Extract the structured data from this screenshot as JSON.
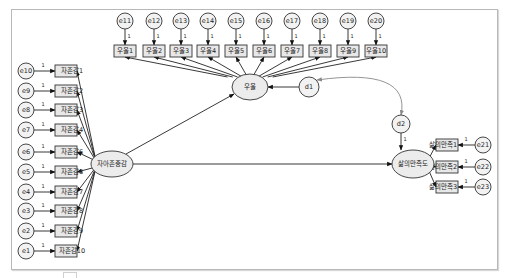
{
  "diagram": {
    "type": "structural-equation-model",
    "latent": [
      {
        "id": "self_esteem",
        "label": "자아존중감",
        "cx": 112,
        "cy": 164,
        "rx": 21,
        "ry": 13
      },
      {
        "id": "depression",
        "label": "우울",
        "cx": 250,
        "cy": 87,
        "rx": 18,
        "ry": 13
      },
      {
        "id": "life_satisfaction",
        "label": "삶의만족도",
        "cx": 413,
        "cy": 164,
        "rx": 21,
        "ry": 14
      }
    ],
    "disturbances": [
      {
        "id": "d1",
        "label": "d1",
        "cx": 309,
        "cy": 87,
        "r": 10,
        "target": "depression"
      },
      {
        "id": "d2",
        "label": "d2",
        "cx": 401,
        "cy": 124,
        "r": 9,
        "target": "life_satisfaction",
        "path_label": "1"
      }
    ],
    "self_esteem_items": [
      {
        "label": "자존감1",
        "error": "e10",
        "y": 71
      },
      {
        "label": "자존감2",
        "error": "e9",
        "y": 91
      },
      {
        "label": "자존감3",
        "error": "e8",
        "y": 110
      },
      {
        "label": "자존감4",
        "error": "e7",
        "y": 130
      },
      {
        "label": "자존감6",
        "error": "e6",
        "y": 152
      },
      {
        "label": "자존감6",
        "error": "e5",
        "y": 172
      },
      {
        "label": "자존감7",
        "error": "e4",
        "y": 192
      },
      {
        "label": "자존감8",
        "error": "e3",
        "y": 211
      },
      {
        "label": "자존감9",
        "error": "e2",
        "y": 231
      },
      {
        "label": "자존감10",
        "error": "e1",
        "y": 251
      }
    ],
    "depression_items": [
      {
        "label": "우울1",
        "error": "e11",
        "x": 125
      },
      {
        "label": "우울2",
        "error": "e12",
        "x": 154
      },
      {
        "label": "우울3",
        "error": "e13",
        "x": 181
      },
      {
        "label": "우울4",
        "error": "e14",
        "x": 208
      },
      {
        "label": "우울5",
        "error": "e15",
        "x": 236
      },
      {
        "label": "우울6",
        "error": "e16",
        "x": 264
      },
      {
        "label": "우울7",
        "error": "e17",
        "x": 292
      },
      {
        "label": "우울8",
        "error": "e18",
        "x": 320
      },
      {
        "label": "우울9",
        "error": "e19",
        "x": 348
      },
      {
        "label": "우울10",
        "error": "e20",
        "x": 376
      }
    ],
    "life_satisfaction_items": [
      {
        "label": "삶의만족1",
        "error": "e21",
        "y": 145
      },
      {
        "label": "삶의만족2",
        "error": "e22",
        "y": 167
      },
      {
        "label": "삶의만족3",
        "error": "e23",
        "y": 187
      }
    ],
    "fixed_loading_label": "1",
    "structural_paths": [
      {
        "from": "self_esteem",
        "to": "depression"
      },
      {
        "from": "self_esteem",
        "to": "life_satisfaction"
      }
    ],
    "covariances": [
      {
        "between": [
          "d1",
          "d2"
        ]
      }
    ],
    "colors": {
      "latent_fill": "#ececec",
      "box_fill": "#e8e8e8",
      "stroke": "#333333",
      "covariance": "#888888",
      "frame": "#b8b8b8"
    }
  }
}
